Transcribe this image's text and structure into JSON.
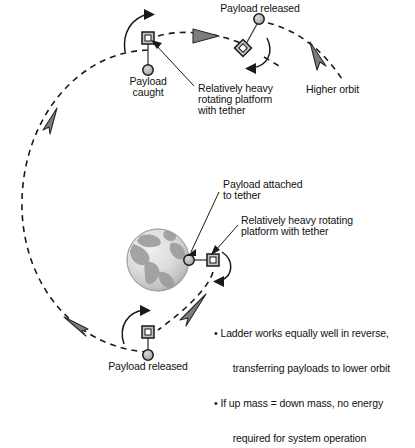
{
  "figure": {
    "colors": {
      "line": "#1a1a1a",
      "arrow_fill": "#7d7d7d",
      "node_fill": "#b3b3b3",
      "earth_light": "#e2e2e2",
      "earth_dark": "#9a9a9a",
      "text": "#111111"
    }
  },
  "labels": {
    "payload_released_top": "Payload released",
    "higher_orbit": "Higher orbit",
    "payload_caught": "Payload\ncaught",
    "payload_caught_line1": "Payload",
    "payload_caught_line2": "caught",
    "heavy_platform_top": "Relatively heavy\nrotating platform\nwith tether",
    "heavy_platform_top_l1": "Relatively heavy",
    "heavy_platform_top_l2": "rotating platform",
    "heavy_platform_top_l3": "with tether",
    "payload_attached_l1": "Payload attached",
    "payload_attached_l2": "to tether",
    "heavy_platform_mid_l1": "Relatively heavy rotating",
    "heavy_platform_mid_l2": "platform with tether",
    "payload_released_bottom": "Payload released"
  },
  "bullets": [
    "• Ladder works equally well in reverse,\n   transferring payloads to lower orbit",
    "• If up mass = down mass, no energy\n   required for system operation"
  ],
  "bullet_rows": [
    "• Ladder works equally well in reverse,",
    "  transferring payloads to lower orbit",
    "• If up mass = down mass, no energy",
    "  required for system operation"
  ],
  "cutoff_text": "",
  "nodes": [
    {
      "name": "platform-top-left",
      "shape": "square",
      "x": 148,
      "y": 38
    },
    {
      "name": "payload-caught",
      "shape": "circle",
      "x": 148,
      "y": 70
    },
    {
      "name": "payload-released-top",
      "shape": "circle",
      "x": 259,
      "y": 19
    },
    {
      "name": "platform-top-right",
      "shape": "diamond",
      "x": 243,
      "y": 48
    },
    {
      "name": "payload-attached-mid",
      "shape": "circle",
      "x": 189,
      "y": 260
    },
    {
      "name": "platform-mid",
      "shape": "square",
      "x": 213,
      "y": 260
    },
    {
      "name": "platform-bottom",
      "shape": "square",
      "x": 148,
      "y": 332
    },
    {
      "name": "payload-released-bottom",
      "shape": "circle",
      "x": 148,
      "y": 355
    }
  ],
  "orbit": {
    "type": "dashed-ellipse",
    "center_x": 150,
    "center_y": 200,
    "radius_x": 128,
    "radius_y": 150,
    "direction_arrows": 4
  }
}
